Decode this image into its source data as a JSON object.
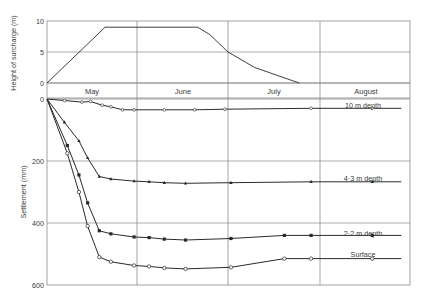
{
  "chart_data": [
    {
      "type": "line",
      "title": "",
      "xlabel": "",
      "ylabel": "Height of surcharge (m)",
      "ylim": [
        0,
        10
      ],
      "yticks": [
        0,
        5,
        10
      ],
      "grid": true,
      "x_unit": "days from start of May",
      "series": [
        {
          "name": "Surcharge height",
          "marker": "none",
          "points": [
            [
              0,
              0
            ],
            [
              20,
              9
            ],
            [
              51,
              9
            ],
            [
              55,
              7.8
            ],
            [
              61,
              5
            ],
            [
              70,
              2.5
            ],
            [
              85,
              0
            ]
          ]
        }
      ]
    },
    {
      "type": "line",
      "title": "",
      "xlabel": "",
      "ylabel": "Settlement (mm)",
      "ylim": [
        0,
        600
      ],
      "y_inverted": true,
      "yticks": [
        0,
        200,
        400,
        600
      ],
      "grid": true,
      "categories": [
        "May",
        "June",
        "July",
        "August"
      ],
      "x_unit": "days from start of May",
      "series": [
        {
          "name": "10 m depth",
          "label": "10 m  depth",
          "marker": "open-square",
          "points": [
            [
              0,
              0
            ],
            [
              6,
              5
            ],
            [
              12,
              10
            ],
            [
              15,
              8
            ],
            [
              19,
              20
            ],
            [
              22,
              25
            ],
            [
              26,
              35
            ],
            [
              30,
              35
            ],
            [
              40,
              35
            ],
            [
              50,
              35
            ],
            [
              60,
              33
            ],
            [
              89,
              30
            ],
            [
              110,
              30
            ],
            [
              120,
              30
            ]
          ]
        },
        {
          "name": "4.3 m depth",
          "label": "4·3 m depth",
          "marker": "filled-triangle",
          "points": [
            [
              0,
              0
            ],
            [
              6,
              75
            ],
            [
              11,
              135
            ],
            [
              14,
              190
            ],
            [
              18,
              250
            ],
            [
              22,
              258
            ],
            [
              30,
              265
            ],
            [
              35,
              267
            ],
            [
              40,
              270
            ],
            [
              47,
              272
            ],
            [
              62,
              270
            ],
            [
              89,
              267
            ],
            [
              110,
              267
            ],
            [
              120,
              267
            ]
          ]
        },
        {
          "name": "2.2 m depth",
          "label": "2·2 m depth",
          "marker": "filled-square",
          "points": [
            [
              0,
              0
            ],
            [
              7,
              150
            ],
            [
              11,
              245
            ],
            [
              14,
              335
            ],
            [
              18,
              425
            ],
            [
              22,
              435
            ],
            [
              30,
              445
            ],
            [
              35,
              447
            ],
            [
              40,
              452
            ],
            [
              47,
              455
            ],
            [
              62,
              450
            ],
            [
              80,
              440
            ],
            [
              89,
              440
            ],
            [
              110,
              440
            ],
            [
              120,
              440
            ]
          ]
        },
        {
          "name": "Surface",
          "label": "Surface",
          "marker": "open-circle",
          "points": [
            [
              0,
              0
            ],
            [
              7,
              175
            ],
            [
              11,
              300
            ],
            [
              14,
              410
            ],
            [
              18,
              510
            ],
            [
              22,
              525
            ],
            [
              30,
              537
            ],
            [
              35,
              540
            ],
            [
              40,
              545
            ],
            [
              47,
              548
            ],
            [
              62,
              543
            ],
            [
              80,
              515
            ],
            [
              89,
              515
            ],
            [
              110,
              515
            ],
            [
              120,
              515
            ]
          ]
        }
      ]
    }
  ],
  "panels": {
    "top": {
      "ylabel": "Height of surcharge (m)",
      "ticks": [
        "0",
        "5",
        "10"
      ]
    },
    "months": [
      "May",
      "June",
      "July",
      "August"
    ],
    "bottom": {
      "ylabel": "Settlement  (mm)",
      "ticks": [
        "0",
        "200",
        "400",
        "600"
      ],
      "curve_labels": {
        "d10": "10 m  depth",
        "d43": "4·3 m depth",
        "d22": "2·2 m depth",
        "surface": "Surface"
      }
    }
  },
  "colors": {
    "line": "#2a2a2a",
    "grid": "#8a8a8a",
    "text": "#3a3a3a"
  }
}
